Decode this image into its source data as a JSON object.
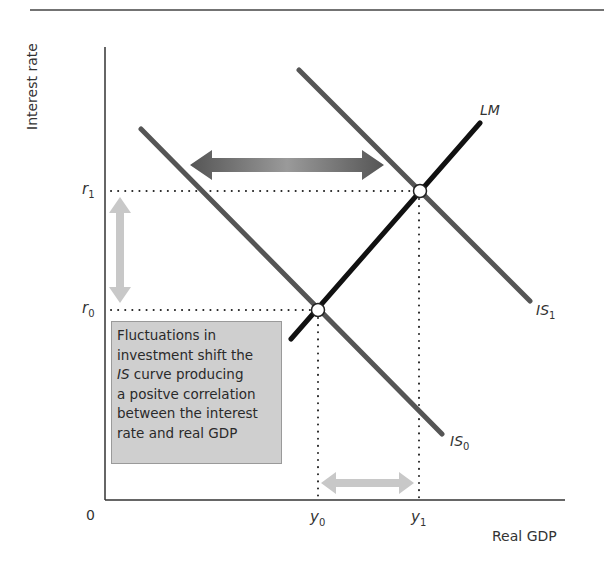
{
  "diagram": {
    "type": "IS-LM diagram",
    "axes": {
      "y_label": "Interest rate",
      "x_label": "Real GDP",
      "origin_label": "0"
    },
    "ticks": {
      "r1": {
        "base": "r",
        "sub": "1"
      },
      "r0": {
        "base": "r",
        "sub": "0"
      },
      "y0": {
        "base": "y",
        "sub": "0"
      },
      "y1": {
        "base": "y",
        "sub": "1"
      }
    },
    "curves": {
      "LM": {
        "label": "LM"
      },
      "IS0": {
        "base": "IS",
        "sub": "0"
      },
      "IS1": {
        "base": "IS",
        "sub": "1"
      }
    },
    "note": {
      "line1": "Fluctuations in",
      "line2": "investment shift the",
      "line3_ital": "IS",
      "line3_rest": " curve producing",
      "line4": "a positve correlation",
      "line5": "between the interest",
      "line6": "rate and real GDP"
    },
    "colors": {
      "axis": "#333333",
      "is_curve": "#555555",
      "lm_curve": "#111111",
      "shift_arrow_dark": "#5a5a5a",
      "shift_arrow_light": "#c8c8c8",
      "note_bg": "#cfcfcf"
    }
  }
}
